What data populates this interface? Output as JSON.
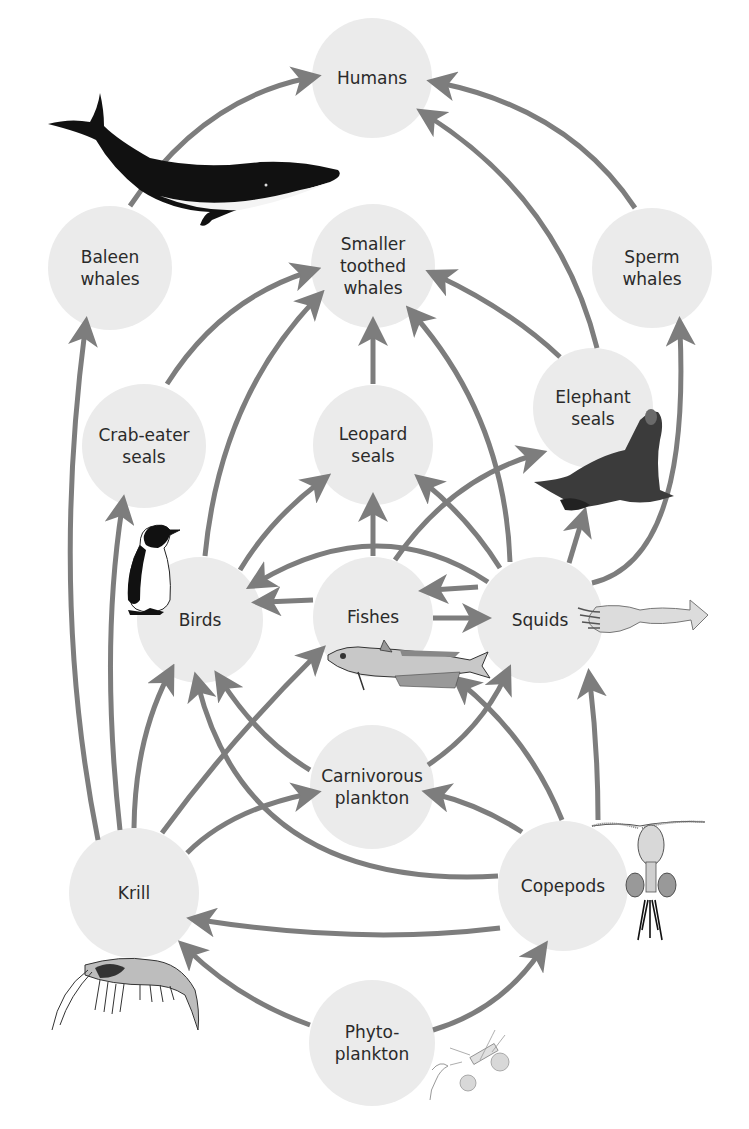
{
  "diagram": {
    "colors": {
      "node_fill": "#ebebeb",
      "arrow": "#7d7d7d",
      "text": "#2a2a2a",
      "background": "#ffffff"
    },
    "nodes": [
      {
        "id": "humans",
        "lines": [
          "Humans"
        ],
        "x": 372,
        "y": 78,
        "r": 60
      },
      {
        "id": "baleen_whales",
        "lines": [
          "Baleen",
          "whales"
        ],
        "x": 110,
        "y": 268,
        "r": 62
      },
      {
        "id": "smaller_toothed_whales",
        "lines": [
          "Smaller",
          "toothed",
          "whales"
        ],
        "x": 373,
        "y": 266,
        "r": 62
      },
      {
        "id": "sperm_whales",
        "lines": [
          "Sperm",
          "whales"
        ],
        "x": 652,
        "y": 268,
        "r": 60
      },
      {
        "id": "crab_eater_seals",
        "lines": [
          "Crab-eater",
          "seals"
        ],
        "x": 144,
        "y": 446,
        "r": 62
      },
      {
        "id": "leopard_seals",
        "lines": [
          "Leopard",
          "seals"
        ],
        "x": 373,
        "y": 445,
        "r": 60
      },
      {
        "id": "elephant_seals",
        "lines": [
          "Elephant",
          "seals"
        ],
        "x": 593,
        "y": 408,
        "r": 60
      },
      {
        "id": "birds",
        "lines": [
          "Birds"
        ],
        "x": 200,
        "y": 620,
        "r": 63
      },
      {
        "id": "fishes",
        "lines": [
          "Fishes"
        ],
        "x": 373,
        "y": 617,
        "r": 60
      },
      {
        "id": "squids",
        "lines": [
          "Squids"
        ],
        "x": 540,
        "y": 620,
        "r": 63
      },
      {
        "id": "carnivorous_plankton",
        "lines": [
          "Carnivorous",
          "plankton"
        ],
        "x": 372,
        "y": 787,
        "r": 62
      },
      {
        "id": "krill",
        "lines": [
          "Krill"
        ],
        "x": 134,
        "y": 893,
        "r": 65
      },
      {
        "id": "copepods",
        "lines": [
          "Copepods"
        ],
        "x": 563,
        "y": 886,
        "r": 65
      },
      {
        "id": "phytoplankton",
        "lines": [
          "Phyto-",
          "plankton"
        ],
        "x": 372,
        "y": 1043,
        "r": 63
      }
    ],
    "edges": [
      {
        "from": "baleen_whales",
        "to": "humans",
        "d": "M 130 206 Q 200 100 308 78"
      },
      {
        "from": "sperm_whales",
        "to": "humans",
        "d": "M 635 208 Q 570 110 440 83"
      },
      {
        "from": "elephant_seals",
        "to": "humans",
        "d": "M 597 348 Q 560 200 428 116"
      },
      {
        "from": "crab_eater_seals",
        "to": "smaller_toothed_whales",
        "d": "M 167 384 Q 220 300 308 272"
      },
      {
        "from": "birds",
        "to": "smaller_toothed_whales",
        "d": "M 205 556 Q 220 400 315 300"
      },
      {
        "from": "leopard_seals",
        "to": "smaller_toothed_whales",
        "d": "M 373 384 L 373 330"
      },
      {
        "from": "elephant_seals",
        "to": "smaller_toothed_whales",
        "d": "M 560 357 Q 510 310 438 276"
      },
      {
        "from": "squids",
        "to": "smaller_toothed_whales",
        "d": "M 510 562 Q 505 420 415 316"
      },
      {
        "from": "squids",
        "to": "sperm_whales",
        "d": "M 592 583 Q 690 560 680 330"
      },
      {
        "from": "squids",
        "to": "elephant_seals",
        "d": "M 569 563 L 582 520"
      },
      {
        "from": "krill",
        "to": "baleen_whales",
        "d": "M 98 840 Q 50 600 85 330"
      },
      {
        "from": "krill",
        "to": "crab_eater_seals",
        "d": "M 120 830 Q 100 650 122 508"
      },
      {
        "from": "birds",
        "to": "leopard_seals",
        "d": "M 240 570 Q 270 520 320 482"
      },
      {
        "from": "fishes",
        "to": "leopard_seals",
        "d": "M 373 556 L 373 506"
      },
      {
        "from": "squids",
        "to": "leopard_seals",
        "d": "M 500 568 Q 470 520 425 483"
      },
      {
        "from": "fishes",
        "to": "elephant_seals",
        "d": "M 395 560 Q 450 480 534 455"
      },
      {
        "from": "squids",
        "to": "birds",
        "d": "M 488 582 Q 380 510 258 582"
      },
      {
        "from": "fishes",
        "to": "birds",
        "d": "M 313 600 L 265 602"
      },
      {
        "from": "squids",
        "to": "fishes",
        "d": "M 478 587 L 432 590"
      },
      {
        "from": "fishes",
        "to": "squids",
        "d": "M 433 618 L 478 618"
      },
      {
        "from": "krill",
        "to": "birds",
        "d": "M 134 828 Q 135 740 168 676"
      },
      {
        "from": "krill",
        "to": "fishes",
        "d": "M 162 833 Q 230 740 316 655"
      },
      {
        "from": "krill",
        "to": "carnivorous_plankton",
        "d": "M 187 853 Q 230 810 308 794"
      },
      {
        "from": "carnivorous_plankton",
        "to": "birds",
        "d": "M 310 770 Q 260 740 222 682"
      },
      {
        "from": "copepods",
        "to": "birds",
        "d": "M 498 876 Q 250 890 198 685"
      },
      {
        "from": "carnivorous_plankton",
        "to": "squids",
        "d": "M 428 765 Q 480 730 505 677"
      },
      {
        "from": "copepods",
        "to": "carnivorous_plankton",
        "d": "M 522 832 Q 480 805 435 794"
      },
      {
        "from": "copepods",
        "to": "fishes",
        "d": "M 562 820 Q 530 740 462 684"
      },
      {
        "from": "copepods",
        "to": "squids",
        "d": "M 598 820 Q 598 750 590 682"
      },
      {
        "from": "copepods",
        "to": "krill",
        "d": "M 500 928 Q 360 945 200 920"
      },
      {
        "from": "phytoplankton",
        "to": "krill",
        "d": "M 310 1025 Q 240 1000 188 950"
      },
      {
        "from": "phytoplankton",
        "to": "copepods",
        "d": "M 433 1030 Q 500 1010 540 952"
      }
    ],
    "illustrations": [
      {
        "id": "whale-illustration",
        "near": "baleen_whales"
      },
      {
        "id": "penguin-illustration",
        "near": "birds"
      },
      {
        "id": "fish-illustration",
        "near": "fishes"
      },
      {
        "id": "squid-illustration",
        "near": "squids"
      },
      {
        "id": "elephant-seal-illustration",
        "near": "elephant_seals"
      },
      {
        "id": "krill-illustration",
        "near": "krill"
      },
      {
        "id": "copepod-illustration",
        "near": "copepods"
      },
      {
        "id": "phytoplankton-illustration",
        "near": "phytoplankton"
      }
    ]
  }
}
